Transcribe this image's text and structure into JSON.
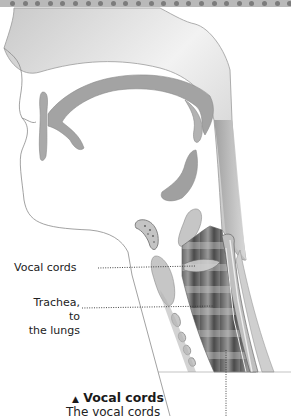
{
  "figure": {
    "labels": [
      {
        "id": "vocal-cords",
        "text": "Vocal cords"
      },
      {
        "id": "trachea",
        "line1": "Trachea, to",
        "line2": "the lungs"
      }
    ],
    "caption": {
      "marker": "▲",
      "title": "Vocal cords",
      "body": "The vocal cords"
    }
  },
  "colors": {
    "band": "#b9b9b9",
    "dot": "#7c7c7c",
    "tissue_light": "#d6d6d6",
    "tissue_mid": "#a8a8a8",
    "tissue_dark": "#555555",
    "outline": "#8a8a8a"
  }
}
